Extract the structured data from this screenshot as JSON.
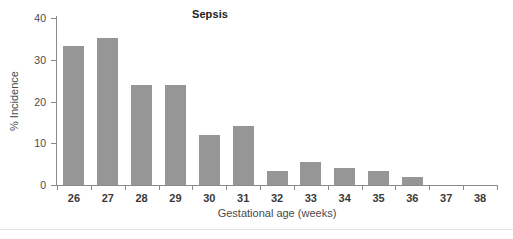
{
  "chart_data": {
    "type": "bar",
    "title": "Sepsis",
    "xlabel": "Gestational age (weeks)",
    "ylabel": "% Incidence",
    "categories": [
      "26",
      "27",
      "28",
      "29",
      "30",
      "31",
      "32",
      "33",
      "34",
      "35",
      "36",
      "37",
      "38"
    ],
    "values": [
      33.3,
      35.1,
      24.0,
      24.0,
      12.0,
      14.2,
      3.3,
      5.4,
      4.1,
      3.3,
      1.9,
      0,
      0
    ],
    "ylim": [
      0,
      40
    ],
    "yticks": [
      0,
      10,
      20,
      30,
      40
    ],
    "ytick_labels": [
      "0",
      "10",
      "20",
      "30",
      "40"
    ],
    "grid": false,
    "legend": null,
    "bar_color": "#969696",
    "axis_color": "#8a8a8a",
    "text_color": "#4a4a4a"
  },
  "figure": {
    "background": "#ffffff"
  }
}
